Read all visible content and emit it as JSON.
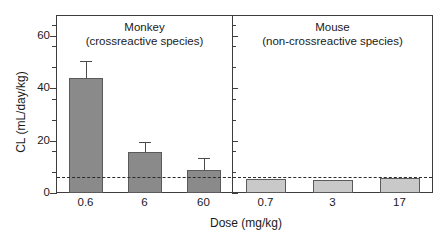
{
  "chart_data": {
    "type": "bar",
    "title": "",
    "xlabel": "Dose (mg/kg)",
    "ylabel": "CL (mL/day/kg)",
    "ylim": [
      0,
      68
    ],
    "yticks": [
      0,
      20,
      40,
      60
    ],
    "ytick_labels": [
      "0",
      "20",
      "40",
      "60"
    ],
    "yminor_ticks": [
      8,
      16,
      28,
      36,
      48,
      56,
      64
    ],
    "grid": false,
    "legend": false,
    "reference_line": {
      "value": 6,
      "style": "dashed",
      "color": "#2b2b2b",
      "label": ""
    },
    "panels": [
      {
        "name": "monkey",
        "title_line1": "Monkey",
        "title_line2": "(crossreactive species)",
        "categories": [
          "0.6",
          "6",
          "60"
        ],
        "values": [
          43.8,
          15.6,
          8.8
        ],
        "errors_upper": [
          50.5,
          19.6,
          13.2
        ],
        "bar_color": "#8a8a8a",
        "bar_edge_color": "#5a5a5a"
      },
      {
        "name": "mouse",
        "title_line1": "Mouse",
        "title_line2": "(non-crossreactive species)",
        "categories": [
          "0.7",
          "3",
          "17"
        ],
        "values": [
          5.3,
          5.0,
          5.6
        ],
        "errors_upper": [
          5.3,
          5.0,
          5.6
        ],
        "bar_color": "#c9c9c9",
        "bar_edge_color": "#5a5a5a"
      }
    ]
  },
  "axes": {
    "ylabel": "CL (mL/day/kg)",
    "xlabel": "Dose (mg/kg)",
    "ytick_0": "0",
    "ytick_20": "20",
    "ytick_40": "40",
    "ytick_60": "60"
  },
  "panel_monkey": {
    "title_line1": "Monkey",
    "title_line2": "(crossreactive species)",
    "xtick_1": "0.6",
    "xtick_2": "6",
    "xtick_3": "60"
  },
  "panel_mouse": {
    "title_line1": "Mouse",
    "title_line2": "(non-crossreactive species)",
    "xtick_1": "0.7",
    "xtick_2": "3",
    "xtick_3": "17"
  }
}
